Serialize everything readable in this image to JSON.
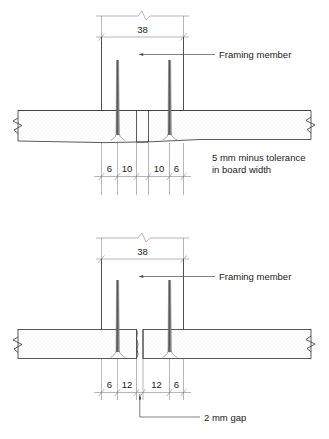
{
  "document": {
    "type": "technical-drawing",
    "subject": "Board fixing to framing member - nail spacing details",
    "background_color": "#ffffff",
    "line_color": "#3d3d3d",
    "text_color": "#1a1a1a"
  },
  "details": [
    {
      "id": "upper-detail",
      "name": "board-with-5mm-minus-tolerance",
      "framing_width": "38",
      "nail_spacing": [
        "6",
        "10",
        "10",
        "6"
      ],
      "labels": {
        "framing_member": "Framing member",
        "note_line_1": "5 mm minus tolerance",
        "note_line_2": "in board width"
      }
    },
    {
      "id": "lower-detail",
      "name": "board-with-2mm-gap",
      "framing_width": "38",
      "nail_spacing": [
        "6",
        "12",
        "12",
        "6"
      ],
      "labels": {
        "framing_member": "Framing member",
        "gap_note": "2 mm gap"
      }
    }
  ],
  "symbols": {
    "break_symbol": "zigzag-break",
    "tick_mark": "oblique-slash",
    "arrow_head": "filled-arrow-left"
  }
}
